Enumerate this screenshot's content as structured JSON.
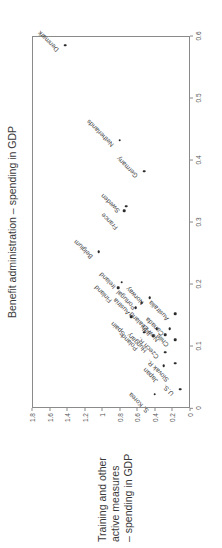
{
  "figure": {
    "benefit_axis_title": "Benefit administration – spending in GDP",
    "training_axis_title_lines": [
      "Training and other",
      "active measures",
      "– spending in GDP"
    ]
  },
  "chart_data": {
    "type": "scatter",
    "title": "",
    "xlabel": "Benefit administration – spending in GDP",
    "ylabel": "Training and other active measures – spending in GDP",
    "xlim": [
      0,
      0.6
    ],
    "ylim": [
      0,
      1.8
    ],
    "xticks": [
      "0",
      "0.1",
      "0.2",
      "0.3",
      "0.4",
      "0.5",
      "0.6"
    ],
    "xtick_values": [
      0,
      0.1,
      0.2,
      0.3,
      0.4,
      0.5,
      0.6
    ],
    "yticks": [
      "0",
      "0.2",
      "0.4",
      "0.6",
      "0.8",
      "1",
      "1.2",
      "1.4",
      "1.6",
      "1.8"
    ],
    "ytick_values": [
      0,
      0.2,
      0.4,
      0.6,
      0.8,
      1.0,
      1.2,
      1.4,
      1.6,
      1.8
    ],
    "grid": false,
    "legend": "none",
    "marker_color": "#2b2b2b",
    "points": [
      {
        "label": "Denmark",
        "x": 0.585,
        "y": 1.42,
        "lx": -6,
        "ly": -3
      },
      {
        "label": "Netherlands",
        "x": 0.432,
        "y": 0.8,
        "lx": -6,
        "ly": -3
      },
      {
        "label": "Germany",
        "x": 0.382,
        "y": 0.52,
        "lx": -6,
        "ly": -3
      },
      {
        "label": "France",
        "x": 0.318,
        "y": 0.75,
        "lx": -18,
        "ly": -3
      },
      {
        "label": "Sweden",
        "x": 0.325,
        "y": 0.73,
        "lx": -6,
        "ly": -3
      },
      {
        "label": "Belgium",
        "x": 0.252,
        "y": 1.04,
        "lx": -6,
        "ly": -3
      },
      {
        "label": "Finland",
        "x": 0.194,
        "y": 0.82,
        "lx": -14,
        "ly": -3
      },
      {
        "label": "Ireland",
        "x": 0.203,
        "y": 0.78,
        "lx": -6,
        "ly": -3
      },
      {
        "label": "Spain",
        "x": 0.147,
        "y": 0.67,
        "lx": -18,
        "ly": -3
      },
      {
        "label": "Austria",
        "x": 0.162,
        "y": 0.62,
        "lx": -6,
        "ly": -3
      },
      {
        "label": "Portugal",
        "x": 0.17,
        "y": 0.55,
        "lx": -6,
        "ly": -3
      },
      {
        "label": "Poland",
        "x": 0.122,
        "y": 0.52,
        "lx": -18,
        "ly": -3
      },
      {
        "label": "Norway",
        "x": 0.178,
        "y": 0.46,
        "lx": -6,
        "ly": -3
      },
      {
        "label": "Hungary",
        "x": 0.116,
        "y": 0.42,
        "lx": -16,
        "ly": -3
      },
      {
        "label": "Italy",
        "x": 0.128,
        "y": 0.38,
        "lx": -6,
        "ly": -3
      },
      {
        "label": "Japan",
        "x": 0.068,
        "y": 0.3,
        "lx": -16,
        "ly": -3
      },
      {
        "label": "Czech R.",
        "x": 0.09,
        "y": 0.28,
        "lx": -6,
        "ly": -3
      },
      {
        "label": "New Zealand",
        "x": 0.118,
        "y": 0.28,
        "lx": -6,
        "ly": -3
      },
      {
        "label": "Canada",
        "x": 0.128,
        "y": 0.23,
        "lx": -6,
        "ly": -3
      },
      {
        "label": "Slovak R.",
        "x": 0.072,
        "y": 0.17,
        "lx": -18,
        "ly": -3
      },
      {
        "label": "Chile",
        "x": 0.11,
        "y": 0.17,
        "lx": -6,
        "ly": -3
      },
      {
        "label": "Australia",
        "x": 0.152,
        "y": 0.17,
        "lx": -6,
        "ly": -3
      },
      {
        "label": "U.S.",
        "x": 0.03,
        "y": 0.11,
        "lx": -6,
        "ly": -3
      },
      {
        "label": "S. Korea",
        "x": 0.022,
        "y": 0.4,
        "lx": -18,
        "ly": -3
      }
    ]
  }
}
